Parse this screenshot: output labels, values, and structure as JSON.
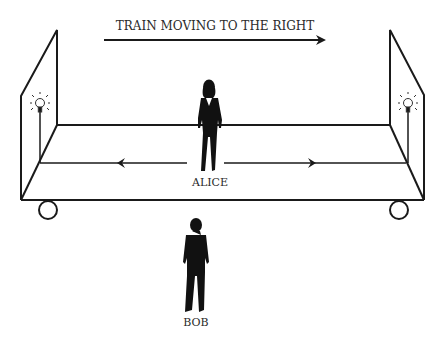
{
  "title": "TRAIN MOVING TO THE RIGHT",
  "figures": {
    "alice": {
      "label": "ALICE",
      "location": "center of train car"
    },
    "bob": {
      "label": "BOB",
      "location": "on ground beside train"
    }
  },
  "elements": {
    "left_bulb": "light-bulb",
    "right_bulb": "light-bulb",
    "light_left_arrow": "arrow-left",
    "light_right_arrow": "arrow-right",
    "motion_arrow": "arrow-right"
  },
  "colors": {
    "line": "#1a1a1a",
    "bulb": "#444444",
    "background": "#ffffff"
  }
}
